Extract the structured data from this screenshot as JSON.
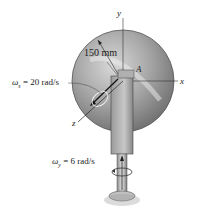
{
  "diagram": {
    "disk_radius_label": "150 mm",
    "point_label": "A",
    "axes": {
      "x": "x",
      "y": "y",
      "z": "z"
    },
    "omega_s": {
      "symbol": "ω",
      "subscript": "s",
      "text": " = 20 rad/s"
    },
    "omega_y": {
      "symbol": "ω",
      "subscript": "y",
      "text": " = 6 rad/s"
    }
  }
}
